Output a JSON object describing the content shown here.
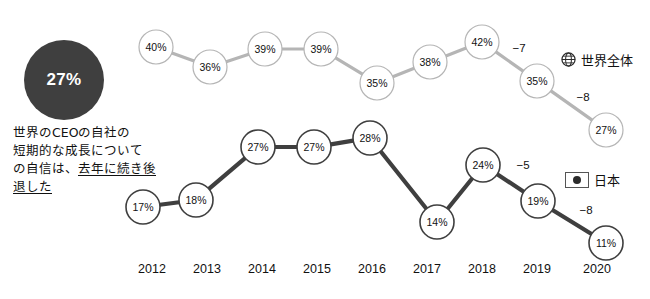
{
  "summary": {
    "value": "27%",
    "caption_lines": [
      "世界のCEOの自社の",
      "短期的な成長について",
      "の自信は、"
    ],
    "caption_tail_plain": "の自信は、",
    "caption_underlined": "去年に続き後退した"
  },
  "legend": {
    "world": {
      "label": "世界全体",
      "icon": "globe-icon",
      "color": "#b5b5b5"
    },
    "japan": {
      "label": "日本",
      "icon": "japan-flag-icon",
      "color": "#3f3f3f"
    }
  },
  "chart_data": {
    "type": "line",
    "title": "",
    "xlabel": "",
    "ylabel": "",
    "categories": [
      "2012",
      "2013",
      "2014",
      "2015",
      "2016",
      "2017",
      "2018",
      "2019",
      "2020"
    ],
    "series": [
      {
        "name": "世界全体",
        "color": "#b5b5b5",
        "values": [
          40,
          36,
          39,
          39,
          35,
          38,
          42,
          35,
          27
        ],
        "labels": [
          "40%",
          "36%",
          "39%",
          "39%",
          "35%",
          "38%",
          "42%",
          "35%",
          "27%"
        ]
      },
      {
        "name": "日本",
        "color": "#3f3f3f",
        "values": [
          17,
          18,
          27,
          27,
          28,
          14,
          24,
          19,
          11
        ],
        "labels": [
          "17%",
          "18%",
          "27%",
          "27%",
          "28%",
          "14%",
          "24%",
          "19%",
          "11%"
        ]
      }
    ],
    "annotations": [
      {
        "series": "世界全体",
        "text": "−7",
        "between": [
          "2018",
          "2019"
        ]
      },
      {
        "series": "世界全体",
        "text": "−8",
        "between": [
          "2019",
          "2020"
        ]
      },
      {
        "series": "日本",
        "text": "−5",
        "between": [
          "2018",
          "2019"
        ]
      },
      {
        "series": "日本",
        "text": "−8",
        "between": [
          "2019",
          "2020"
        ]
      }
    ],
    "grid": false,
    "legend_position": "right"
  },
  "geometry": {
    "world_points": [
      {
        "x": 156,
        "y": 47
      },
      {
        "x": 210,
        "y": 67
      },
      {
        "x": 265,
        "y": 49
      },
      {
        "x": 321,
        "y": 49
      },
      {
        "x": 377,
        "y": 83
      },
      {
        "x": 430,
        "y": 62
      },
      {
        "x": 482,
        "y": 42
      },
      {
        "x": 537,
        "y": 81
      },
      {
        "x": 606,
        "y": 130
      }
    ],
    "japan_points": [
      {
        "x": 143,
        "y": 207
      },
      {
        "x": 196,
        "y": 200
      },
      {
        "x": 258,
        "y": 147
      },
      {
        "x": 314,
        "y": 147
      },
      {
        "x": 370,
        "y": 138
      },
      {
        "x": 437,
        "y": 222
      },
      {
        "x": 483,
        "y": 165
      },
      {
        "x": 538,
        "y": 201
      },
      {
        "x": 606,
        "y": 243
      }
    ],
    "world_deltas": [
      {
        "x": 519,
        "y": 48,
        "text": "−7"
      },
      {
        "x": 583,
        "y": 97,
        "text": "−8"
      }
    ],
    "japan_deltas": [
      {
        "x": 523,
        "y": 165,
        "text": "−5"
      },
      {
        "x": 586,
        "y": 210,
        "text": "−8"
      }
    ],
    "year_label_x": [
      152,
      207,
      262,
      317,
      372,
      427,
      482,
      537,
      597
    ],
    "year_label_y": 262,
    "node_radius": 17
  }
}
